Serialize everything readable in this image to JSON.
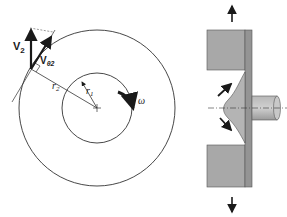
{
  "figure": {
    "left_panel": {
      "description": "Rotating disk with concentric circles",
      "labels": {
        "velocity": "V",
        "velocity_sub": "2",
        "tangential_velocity": "V",
        "tangential_velocity_sub": "θ2",
        "outer_radius": "r",
        "outer_radius_sub": "2",
        "inner_radius": "r",
        "inner_radius_sub": "1",
        "angular_velocity": "ω"
      }
    },
    "right_panel": {
      "description": "Side cross-section of impeller/casing with shaft and flow arrows"
    },
    "colors": {
      "line": "#333333",
      "fill_gray": "#a8a8a8",
      "fill_gray_light": "#c4c4c4",
      "fill_gray_dark": "#8c8c8c",
      "arrow": "#1a1a1a"
    }
  }
}
